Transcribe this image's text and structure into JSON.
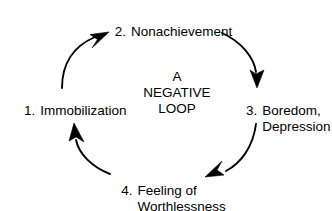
{
  "diagram": {
    "type": "cycle",
    "direction": "clockwise",
    "background_color": "#ffffff",
    "ink_color": "#000000",
    "center_caption": {
      "line1": "A",
      "line2": "NEGATIVE",
      "line3": "LOOP"
    },
    "nodes": [
      {
        "id": "immobilization",
        "number": "1.",
        "line1": "Immobilization",
        "line2": "",
        "position": "left"
      },
      {
        "id": "nonachievement",
        "number": "2.",
        "line1": "Nonachievement",
        "line2": "",
        "position": "top"
      },
      {
        "id": "boredom-depression",
        "number": "3.",
        "line1": "Boredom,",
        "line2": "Depression",
        "position": "right"
      },
      {
        "id": "feeling-of-worthlessness",
        "number": "4.",
        "line1": "Feeling of",
        "line2": "Worthlessness",
        "position": "bottom"
      }
    ],
    "arrows": [
      {
        "id": "arrow-immobilization-to-nonachievement",
        "from": "immobilization",
        "to": "nonachievement",
        "head_direction": "up-right"
      },
      {
        "id": "arrow-nonachievement-to-boredom",
        "from": "nonachievement",
        "to": "boredom-depression",
        "head_direction": "down-right"
      },
      {
        "id": "arrow-boredom-to-worthlessness",
        "from": "boredom-depression",
        "to": "feeling-of-worthlessness",
        "head_direction": "down-left"
      },
      {
        "id": "arrow-worthlessness-to-immobilization",
        "from": "feeling-of-worthlessness",
        "to": "immobilization",
        "head_direction": "up-left"
      }
    ]
  }
}
